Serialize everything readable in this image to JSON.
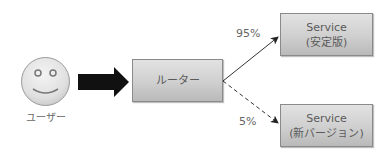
{
  "diagram": {
    "user": {
      "label": "ユーザー",
      "icon": "smiley-face-icon"
    },
    "request_arrow": {
      "icon": "thick-right-arrow-icon",
      "color": "#111111"
    },
    "router": {
      "label": "ルーター"
    },
    "services": [
      {
        "line1": "Service",
        "line2": "(安定版)",
        "traffic": "95%",
        "edge_style": "solid"
      },
      {
        "line1": "Service",
        "line2": "(新バージョン)",
        "traffic": "5%",
        "edge_style": "dashed"
      }
    ],
    "colors": {
      "node_fill_top": "#e2e2e2",
      "node_fill_bottom": "#b9b9b9",
      "node_border": "#8a8a8a",
      "text": "#5a5a5a",
      "edge": "#333333"
    }
  }
}
